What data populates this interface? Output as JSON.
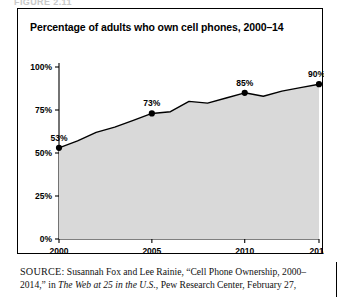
{
  "figure": {
    "running_head": "FIGURE 2.11",
    "title": "Percentage of adults who own cell phones, 2000–14"
  },
  "source": {
    "kicker": "SOURCE:",
    "line1": " Susannah Fox and Lee Rainie, “Cell Phone Ownership, 2000–",
    "line2_pre": "2014,” in ",
    "line2_italic": "The Web at 25 in the U.S.",
    "line2_post": ", Pew Research Center, February 27,"
  },
  "chart_data": {
    "type": "area",
    "title": "Percentage of adults who own cell phones, 2000–14",
    "xlabel": "",
    "ylabel": "",
    "xlim": [
      2000,
      2014
    ],
    "ylim": [
      0,
      100
    ],
    "grid": false,
    "legend": "none",
    "xticks": [
      "2000",
      "2005",
      "2010",
      "2014"
    ],
    "xtick_values": [
      2000,
      2005,
      2010,
      2014
    ],
    "yticks": [
      "0%",
      "25%",
      "50%",
      "75%",
      "100%"
    ],
    "ytick_values": [
      0,
      25,
      50,
      75,
      100
    ],
    "series": [
      {
        "name": "Adults who own cell phones",
        "x": [
          2000,
          2001,
          2002,
          2003,
          2004,
          2005,
          2006,
          2007,
          2008,
          2009,
          2010,
          2011,
          2012,
          2013,
          2014
        ],
        "values": [
          53,
          57,
          62,
          65,
          69,
          73,
          74,
          80,
          79,
          82,
          85,
          83,
          86,
          88,
          90
        ],
        "line_color": "#000000",
        "fill_color": "#d9d9d9"
      }
    ],
    "labeled_points": [
      {
        "x": 2000,
        "value": 53,
        "label": "53%"
      },
      {
        "x": 2005,
        "value": 73,
        "label": "73%"
      },
      {
        "x": 2010,
        "value": 85,
        "label": "85%"
      },
      {
        "x": 2014,
        "value": 90,
        "label": "90%"
      }
    ],
    "marker_color": "#000000"
  }
}
